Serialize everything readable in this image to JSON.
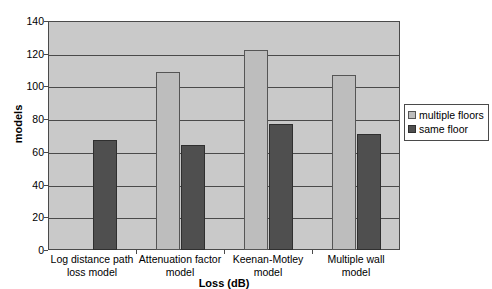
{
  "chart_data": {
    "type": "bar",
    "title": "",
    "subtitle": "",
    "xlabel": "Loss (dB)",
    "ylabel": "models",
    "categories": [
      "Log distance path loss model",
      "Attenuation factor model",
      "Keenan-Motley model",
      "Multiple wall model"
    ],
    "category_lines": [
      [
        "Log distance path",
        "loss model"
      ],
      [
        "Attenuation factor",
        "model"
      ],
      [
        "Keenan-Motley",
        "model"
      ],
      [
        "Multiple wall",
        "model"
      ]
    ],
    "series": [
      {
        "name": "multiple floors",
        "color": "#bdbdbd",
        "values": [
          0,
          109,
          122,
          107
        ]
      },
      {
        "name": "same floor",
        "color": "#4f4f4f",
        "values": [
          67,
          64,
          77,
          71
        ]
      }
    ],
    "ylim": [
      0,
      140
    ],
    "yticks": [
      0,
      20,
      40,
      60,
      80,
      100,
      120,
      140
    ],
    "ytick_labels": [
      "0",
      "20",
      "40",
      "60",
      "80",
      "100",
      "120",
      "140"
    ],
    "grid": true,
    "grid_axis": "y",
    "legend_position": "right",
    "plot_background": "#c9c9c9",
    "figure_background": "#ffffff",
    "axis_color": "#4a4a4a"
  }
}
